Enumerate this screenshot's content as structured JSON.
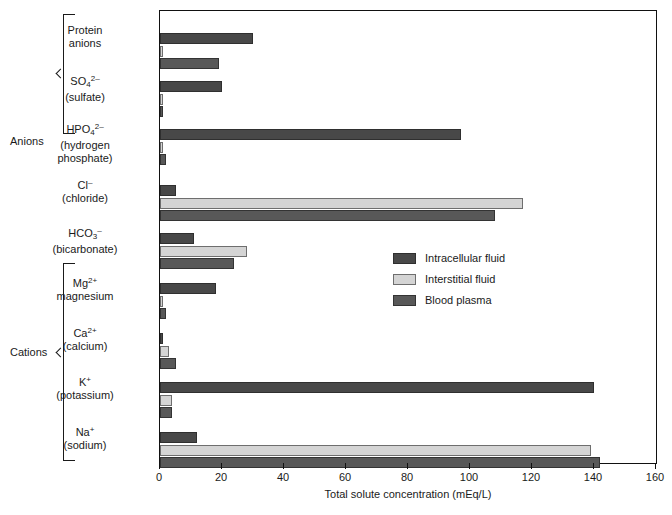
{
  "chart_data": {
    "type": "bar",
    "orientation": "horizontal",
    "title": "",
    "xlabel": "Total solute concentration (mEq/L)",
    "ylabel": "",
    "xlim": [
      0,
      160
    ],
    "xticks": [
      0,
      20,
      40,
      60,
      80,
      100,
      120,
      140,
      160
    ],
    "grid": false,
    "legend_position": "inside-center-right",
    "categories": [
      "Protein anions",
      "SO4 2- (sulfate)",
      "HPO4 2- (hydrogen phosphate)",
      "Cl- (chloride)",
      "HCO3- (bicarbonate)",
      "Mg2+ magnesium",
      "Ca2+ (calcium)",
      "K+ (potassium)",
      "Na+ (sodium)"
    ],
    "series": [
      {
        "name": "Intracellular fluid",
        "color": "#484848",
        "values": [
          30,
          20,
          97,
          5,
          11,
          18,
          1,
          140,
          12
        ]
      },
      {
        "name": "Interstitial fluid",
        "color": "#d4d4d4",
        "values": [
          1,
          1,
          1,
          117,
          28,
          1,
          3,
          4,
          139
        ]
      },
      {
        "name": "Blood plasma",
        "color": "#585858",
        "values": [
          19,
          1,
          2,
          108,
          24,
          2,
          5,
          4,
          142
        ]
      }
    ],
    "groups": [
      {
        "name": "Anions",
        "categories": [
          "Protein anions",
          "SO4 2-",
          "HPO4 2-",
          "Cl-",
          "HCO3-"
        ]
      },
      {
        "name": "Cations",
        "categories": [
          "Mg2+",
          "Ca2+",
          "K+",
          "Na+"
        ]
      }
    ]
  },
  "groups": {
    "anions_label": "Anions",
    "cations_label": "Cations"
  },
  "categories": [
    {
      "line1": "Protein",
      "line2": "anions",
      "line3": ""
    },
    {
      "line1": "SO",
      "sub1": "4",
      "sup1": "2–",
      "line2": "(sulfate)",
      "line3": ""
    },
    {
      "line1": "HPO",
      "sub1": "4",
      "sup1": "2–",
      "line2": "(hydrogen",
      "line3": "phosphate)"
    },
    {
      "line1": "Cl",
      "sup1": "–",
      "line2": "(chloride)",
      "line3": ""
    },
    {
      "line1": "HCO",
      "sub1": "3",
      "sup1": "–",
      "line2": "(bicarbonate)",
      "line3": ""
    },
    {
      "line1": "Mg",
      "sup1": "2+",
      "line2": "magnesium",
      "line3": ""
    },
    {
      "line1": "Ca",
      "sup1": "2+",
      "line2": "(calcium)",
      "line3": ""
    },
    {
      "line1": "K",
      "sup1": "+",
      "line2": "(potassium)",
      "line3": ""
    },
    {
      "line1": "Na",
      "sup1": "+",
      "line2": "(sodium)",
      "line3": ""
    }
  ],
  "axis": {
    "title": "Total solute concentration (mEq/L)",
    "ticks": [
      "0",
      "20",
      "40",
      "60",
      "80",
      "100",
      "120",
      "140",
      "160"
    ]
  },
  "legend": {
    "items": [
      {
        "label": "Intracellular fluid",
        "key": "icf"
      },
      {
        "label": "Interstitial fluid",
        "key": "isf"
      },
      {
        "label": "Blood plasma",
        "key": "plasma"
      }
    ]
  }
}
